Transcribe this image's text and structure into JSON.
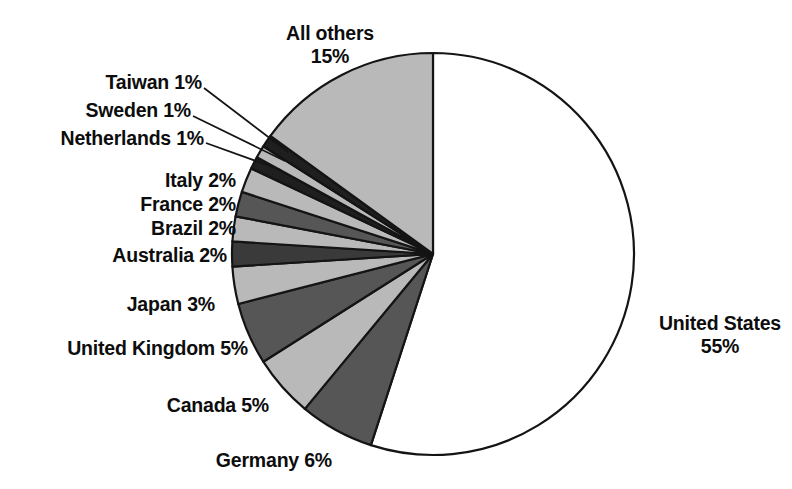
{
  "chart_data": {
    "type": "pie",
    "title": "",
    "subtitle": "",
    "xlabel": "",
    "ylabel": "",
    "legend_position": "none",
    "grid": false,
    "start_angle_deg": 0,
    "direction": "clockwise",
    "units": "percent",
    "categories": [
      "United States",
      "Germany",
      "Canada",
      "United Kingdom",
      "Japan",
      "Australia",
      "Brazil",
      "France",
      "Italy",
      "Netherlands",
      "Sweden",
      "Taiwan",
      "All others"
    ],
    "values": [
      55,
      6,
      5,
      5,
      3,
      2,
      2,
      2,
      2,
      1,
      1,
      1,
      15
    ],
    "labels": [
      "United States 55%",
      "Germany 6%",
      "Canada 5%",
      "United Kingdom 5%",
      "Japan 3%",
      "Australia 2%",
      "Brazil 2%",
      "France 2%",
      "Italy 2%",
      "Netherlands 1%",
      "Sweden 1%",
      "Taiwan 1%",
      "All others 15%"
    ],
    "slice_fills": [
      "#ffffff",
      "#565656",
      "#b9b9b9",
      "#565656",
      "#b9b9b9",
      "#3a3a3a",
      "#b9b9b9",
      "#565656",
      "#b9b9b9",
      "#1f1f1f",
      "#b9b9b9",
      "#1f1f1f",
      "#b9b9b9"
    ],
    "stroke_color": "#141414"
  },
  "labels": {
    "all_others": {
      "line1": "All others",
      "line2": "15%"
    },
    "taiwan": {
      "text": "Taiwan 1%"
    },
    "sweden": {
      "text": "Sweden 1%"
    },
    "netherlands": {
      "text": "Netherlands 1%"
    },
    "italy": {
      "text": "Italy 2%"
    },
    "france": {
      "text": "France 2%"
    },
    "brazil": {
      "text": "Brazil 2%"
    },
    "australia": {
      "text": "Australia 2%"
    },
    "japan": {
      "text": "Japan 3%"
    },
    "united_kingdom": {
      "text": "United Kingdom 5%"
    },
    "canada": {
      "text": "Canada 5%"
    },
    "germany": {
      "text": "Germany 6%"
    },
    "united_states": {
      "line1": "United States",
      "line2": "55%"
    }
  },
  "geometry": {
    "center_x": 433,
    "center_y": 254,
    "radius": 201
  },
  "colors": {
    "background": "#ffffff",
    "text": "#0d0d0d",
    "outline": "#141414",
    "light_gray": "#b9b9b9",
    "mid_gray": "#565656",
    "dark_gray": "#1f1f1f",
    "white": "#ffffff"
  }
}
